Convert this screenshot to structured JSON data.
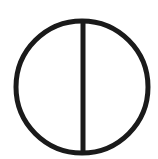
{
  "diagram": {
    "shape": "circle-with-vertical-diameter",
    "stroke_color": "#1a1a1a",
    "background_color": "#ffffff",
    "circle": {
      "cx": 82,
      "cy": 87,
      "r": 66,
      "stroke_width": 5
    },
    "diameter_line": {
      "x": 83,
      "y1": 21,
      "y2": 153,
      "stroke_width": 5
    }
  }
}
